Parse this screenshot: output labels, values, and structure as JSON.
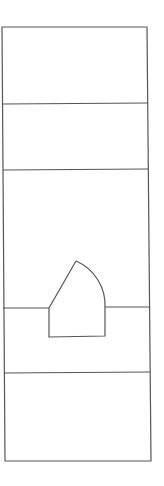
{
  "canvas": {
    "width": 164,
    "height": 486,
    "background": "#ffffff"
  },
  "style": {
    "stroke": "#555555",
    "stroke_width": 1.2
  },
  "outline": {
    "top_left": [
      2,
      27
    ],
    "top_right": [
      147,
      27
    ],
    "bottom_right": [
      151,
      461
    ],
    "bottom_left": [
      5,
      461
    ]
  },
  "dividers": [
    {
      "y_left": 104,
      "y_right": 103,
      "x_left": 3,
      "x_right": 148
    },
    {
      "y_left": 170,
      "y_right": 169,
      "x_left": 3,
      "x_right": 148
    },
    {
      "y_left": 373,
      "y_right": 372,
      "x_left": 4,
      "x_right": 150
    }
  ],
  "ledges": [
    {
      "name": "left-ledge",
      "x1": 3,
      "y1": 308,
      "x2": 49,
      "y2": 308
    },
    {
      "name": "right-ledge",
      "x1": 105,
      "y1": 307,
      "x2": 150,
      "y2": 307
    }
  ],
  "house_shape": {
    "bottom_left": [
      49,
      337
    ],
    "bottom_right": [
      105,
      336
    ],
    "left_wall_top": [
      49,
      308
    ],
    "apex": [
      76,
      261
    ],
    "right_wall_top": [
      105,
      307
    ],
    "arc_radius": 48
  }
}
